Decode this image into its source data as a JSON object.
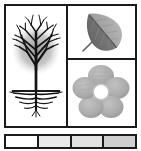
{
  "figure": {
    "frame_color": "#1b1b1b",
    "background_color": "#ffffff"
  },
  "panels": [
    {
      "id": "tree",
      "label": "Tree with root system",
      "icon": "tree-with-roots-icon",
      "position": "left-column",
      "canopy_color": "#141414",
      "canopy_halo_color": "#8d8d8d",
      "ground_line_color": "#1a1a1a",
      "root_color": "#141414"
    },
    {
      "id": "leaf",
      "label": "Leaf blade with midrib",
      "icon": "leaf-icon",
      "position": "right-column-top",
      "dark_half_color": "#6b6b6b",
      "light_half_color": "#a9a9a9",
      "midrib_color": "#4a4a4a",
      "stem_color": "#5a5a5a",
      "tilt_degrees": 40
    },
    {
      "id": "flower",
      "label": "Five-petal flower",
      "icon": "flower-icon",
      "position": "right-column-bottom",
      "petal_count": 5,
      "petal_color": "#b3b3b3",
      "petal_shadow_color": "#9d9d9d",
      "center_color": "#ffffff",
      "center_ring_color": "#c5c5c5"
    }
  ],
  "scale_strip": {
    "label": "Grayscale value strip",
    "cell_count": 4,
    "cells": [
      {
        "index": 1,
        "value": "#ffffff",
        "tone": "white"
      },
      {
        "index": 2,
        "value": "#e9e9e9",
        "tone": "very light gray"
      },
      {
        "index": 3,
        "value": "#e2e2e2",
        "tone": "light gray"
      },
      {
        "index": 4,
        "value": "#cfcfcf",
        "tone": "gray"
      }
    ]
  }
}
